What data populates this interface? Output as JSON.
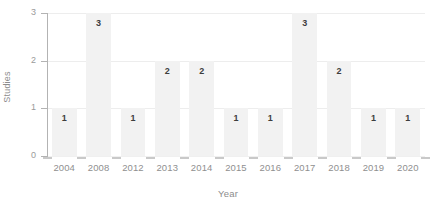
{
  "chart_data": {
    "type": "bar",
    "title": "",
    "xlabel": "Year",
    "ylabel": "Studies",
    "categories": [
      "2004",
      "2008",
      "2012",
      "2013",
      "2014",
      "2015",
      "2016",
      "2017",
      "2018",
      "2019",
      "2020"
    ],
    "values": [
      1,
      3,
      1,
      2,
      2,
      1,
      1,
      3,
      2,
      1,
      1
    ],
    "data_labels": [
      "1",
      "3",
      "1",
      "2",
      "2",
      "1",
      "1",
      "3",
      "2",
      "1",
      "1"
    ],
    "ylim": [
      0,
      3
    ],
    "yticks": [
      0,
      1,
      2,
      3
    ],
    "ytick_labels": [
      "0",
      "1",
      "2",
      "3"
    ],
    "grid": true,
    "grid_axis": "y",
    "legend": false,
    "legend_position": "none",
    "bar_color": "#f2f2f2",
    "grid_color": "#ededed",
    "axis_color": "#b3b3b3",
    "label_color": "#8f8f8f",
    "data_label_color": "#3d3d3d",
    "background_color": "#ffffff"
  }
}
